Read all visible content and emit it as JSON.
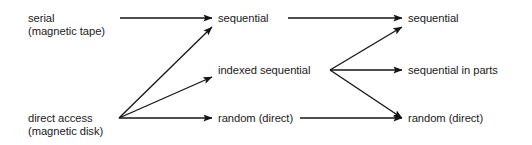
{
  "diagram": {
    "type": "flow-diagram",
    "canvas": {
      "width": 532,
      "height": 145,
      "background": "#ffffff"
    },
    "style": {
      "line_color": "#141414",
      "text_color": "#1a1a1a",
      "line_width": 1.3
    },
    "columns": [
      {
        "id": "col-left",
        "x": 28
      },
      {
        "id": "col-middle",
        "x": 218
      },
      {
        "id": "col-right",
        "x": 408
      }
    ],
    "nodes": [
      {
        "id": "serial",
        "column": "col-left",
        "row": "top",
        "x": 28,
        "y": 12,
        "lines": [
          "serial",
          "(magnetic tape)"
        ]
      },
      {
        "id": "direct-access",
        "column": "col-left",
        "row": "bottom",
        "x": 28,
        "y": 112,
        "lines": [
          "direct access",
          "(magnetic disk)"
        ]
      },
      {
        "id": "mid-sequential",
        "column": "col-middle",
        "row": "top",
        "x": 218,
        "y": 12,
        "lines": [
          "sequential"
        ]
      },
      {
        "id": "mid-indexed-sequential",
        "column": "col-middle",
        "row": "middle",
        "x": 218,
        "y": 64,
        "lines": [
          "indexed sequential"
        ]
      },
      {
        "id": "mid-random",
        "column": "col-middle",
        "row": "bottom",
        "x": 218,
        "y": 112,
        "lines": [
          "random (direct)"
        ]
      },
      {
        "id": "right-sequential",
        "column": "col-right",
        "row": "top",
        "x": 408,
        "y": 12,
        "lines": [
          "sequential"
        ]
      },
      {
        "id": "right-sequential-in-parts",
        "column": "col-right",
        "row": "middle",
        "x": 408,
        "y": 64,
        "lines": [
          "sequential in parts"
        ]
      },
      {
        "id": "right-random",
        "column": "col-right",
        "row": "bottom",
        "x": 408,
        "y": 112,
        "lines": [
          "random (direct)"
        ]
      }
    ],
    "edges": [
      {
        "id": "edge-serial-to-sequential",
        "from": "serial",
        "to": "mid-sequential",
        "x1": 120,
        "y1": 18,
        "x2": 212,
        "y2": 18
      },
      {
        "id": "edge-direct-to-sequential",
        "from": "direct-access",
        "to": "mid-sequential",
        "x1": 119,
        "y1": 118,
        "x2": 212,
        "y2": 27
      },
      {
        "id": "edge-direct-to-indexed",
        "from": "direct-access",
        "to": "mid-indexed-sequential",
        "x1": 119,
        "y1": 118,
        "x2": 212,
        "y2": 77
      },
      {
        "id": "edge-direct-to-random",
        "from": "direct-access",
        "to": "mid-random",
        "x1": 119,
        "y1": 118,
        "x2": 212,
        "y2": 118
      },
      {
        "id": "edge-midseq-to-rightseq",
        "from": "mid-sequential",
        "to": "right-sequential",
        "x1": 288,
        "y1": 18,
        "x2": 402,
        "y2": 18
      },
      {
        "id": "edge-indexed-to-sequential",
        "from": "mid-indexed-sequential",
        "to": "right-sequential",
        "x1": 330,
        "y1": 70,
        "x2": 402,
        "y2": 27
      },
      {
        "id": "edge-indexed-to-inparts",
        "from": "mid-indexed-sequential",
        "to": "right-sequential-in-parts",
        "x1": 330,
        "y1": 70,
        "x2": 402,
        "y2": 70
      },
      {
        "id": "edge-indexed-to-random",
        "from": "mid-indexed-sequential",
        "to": "right-random",
        "x1": 330,
        "y1": 70,
        "x2": 402,
        "y2": 118
      },
      {
        "id": "edge-midrandom-to-rightrandom",
        "from": "mid-random",
        "to": "right-random",
        "x1": 300,
        "y1": 118,
        "x2": 402,
        "y2": 118
      }
    ]
  }
}
